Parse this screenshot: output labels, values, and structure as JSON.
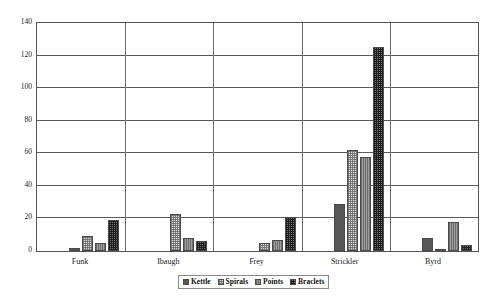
{
  "chart_data": {
    "type": "bar",
    "title": "",
    "subtitle": "",
    "xlabel": "",
    "ylabel": "",
    "categories": [
      "Funk",
      "Ibaugh",
      "Frey",
      "Strickler",
      "Byrd"
    ],
    "series": [
      {
        "name": "Kettle",
        "values": [
          2,
          0,
          0,
          29,
          8
        ]
      },
      {
        "name": "Spirals",
        "values": [
          9,
          23,
          5,
          62,
          1
        ]
      },
      {
        "name": "Points",
        "values": [
          5,
          8,
          7,
          58,
          18
        ]
      },
      {
        "name": "Braclets",
        "values": [
          19,
          6,
          21,
          125,
          4
        ]
      }
    ],
    "ylim": [
      0,
      140
    ],
    "yticks": [
      0,
      20,
      40,
      60,
      80,
      100,
      120,
      140
    ],
    "ytick_labels": [
      "0",
      "20",
      "40",
      "60",
      "80",
      "100",
      "120",
      "140"
    ],
    "grid": true,
    "legend_position": "bottom-center",
    "series_colors": [
      "#575757",
      "#d8d8d8",
      "#9d9d9d",
      "#6b6b6b"
    ],
    "axis_color": "#555555",
    "background": "#ffffff"
  },
  "legend": {
    "items": [
      {
        "label": "Kettle"
      },
      {
        "label": "Spirals"
      },
      {
        "label": "Points"
      },
      {
        "label": "Braclets"
      }
    ]
  }
}
